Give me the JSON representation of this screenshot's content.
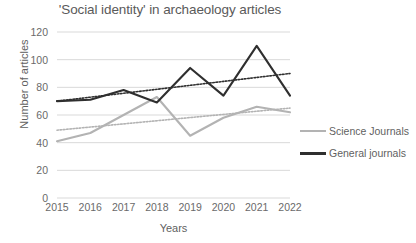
{
  "chart_data": {
    "type": "line",
    "title": "'Social identity' in archaeology articles",
    "xlabel": "Years",
    "ylabel": "Number of articles",
    "categories": [
      "2015",
      "2016",
      "2017",
      "2018",
      "2019",
      "2020",
      "2021",
      "2022"
    ],
    "ylim": [
      0,
      120
    ],
    "yticks": [
      0,
      20,
      40,
      60,
      80,
      100,
      120
    ],
    "grid": true,
    "legend_position": "right",
    "series": [
      {
        "name": "Science Journals",
        "color": "#b3b3b3",
        "values": [
          41,
          47,
          60,
          73,
          45,
          58,
          66,
          62
        ],
        "trendline": {
          "start": 49,
          "end": 65,
          "style": "dotted"
        }
      },
      {
        "name": "General journals",
        "color": "#2f2f2f",
        "values": [
          70,
          71,
          78,
          69,
          94,
          74,
          110,
          74
        ],
        "trendline": {
          "start": 70,
          "end": 90,
          "style": "dotted"
        }
      }
    ]
  },
  "legend": {
    "items": [
      {
        "label": "Science Journals"
      },
      {
        "label": "General journals"
      }
    ]
  }
}
